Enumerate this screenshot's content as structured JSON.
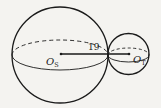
{
  "diagram": {
    "type": "two tangent spheres",
    "large_sphere": {
      "center_label": "O",
      "center_subscript": "S"
    },
    "small_sphere": {
      "center_label": "O",
      "center_subscript": "T"
    },
    "segment_label": "19",
    "colors": {
      "stroke": "#1a1a1a",
      "background": "#f4f3f0"
    }
  }
}
